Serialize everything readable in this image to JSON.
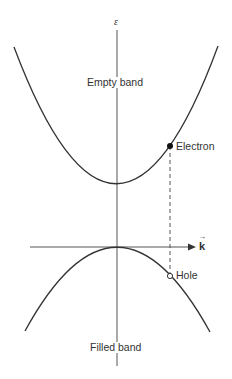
{
  "diagram": {
    "axes": {
      "energy_label": "ε",
      "momentum_label": "k",
      "momentum_vector_arrow": "→"
    },
    "bands": {
      "conduction": {
        "label": "Empty band"
      },
      "valence": {
        "label": "Filled band"
      }
    },
    "carriers": {
      "electron": {
        "label": "Electron",
        "marker": "filled-circle"
      },
      "hole": {
        "label": "Hole",
        "marker": "open-circle"
      }
    },
    "colors": {
      "line": "#333333",
      "axis": "#555555",
      "background": "#ffffff"
    }
  }
}
